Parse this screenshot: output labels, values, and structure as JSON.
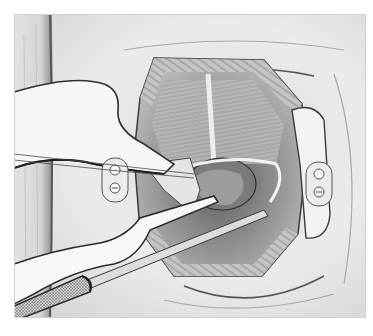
{
  "figure": {
    "kind": "surgical-illustration",
    "style": "grayscale pencil drawing",
    "colors": {
      "background": "#ffffff",
      "skin": "#e6e6e6",
      "shadow": "#9a9a9a",
      "tissue_dark": "#6e6e6e",
      "instrument": "#f4f4f4",
      "outline": "#3a3a3a"
    },
    "elements": [
      {
        "name": "drape",
        "label": ""
      },
      {
        "name": "left-retractor",
        "label": ""
      },
      {
        "name": "right-retractor",
        "label": ""
      },
      {
        "name": "surgical-cavity",
        "label": ""
      },
      {
        "name": "scalpel",
        "label": ""
      },
      {
        "name": "forceps",
        "label": ""
      },
      {
        "name": "suture-threads",
        "label": ""
      }
    ]
  }
}
